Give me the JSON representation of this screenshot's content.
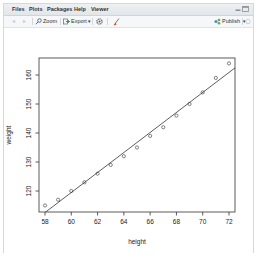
{
  "tabs": [
    {
      "label": "Files"
    },
    {
      "label": "Plots"
    },
    {
      "label": "Packages"
    },
    {
      "label": "Help"
    },
    {
      "label": "Viewer"
    }
  ],
  "toolbar": {
    "back_icon": "left-arrow-icon",
    "forward_icon": "right-arrow-icon",
    "zoom_label": "Zoom",
    "export_label": "Export",
    "export_caret": "▾",
    "refresh_icon": "gear-icon",
    "clear_icon": "broom-icon",
    "publish_label": "Publish",
    "publish_caret": "▾"
  },
  "window_controls": {
    "minimize_icon": "minimize-icon",
    "maximize_icon": "maximize-icon"
  },
  "colors": {
    "tabbar_bg": "#e6e9ec",
    "toolbar_bg": "#f6f7f8",
    "plot_line": "#222222",
    "point_stroke": "#222222"
  },
  "chart_data": {
    "type": "scatter",
    "title": "",
    "xlabel": "height",
    "ylabel": "weight",
    "xlim": [
      57.44,
      72.56
    ],
    "ylim": [
      113.04,
      165.96
    ],
    "xticks": [
      58,
      60,
      62,
      64,
      66,
      68,
      70,
      72
    ],
    "yticks": [
      120,
      130,
      140,
      150,
      160
    ],
    "grid": false,
    "legend": null,
    "x": [
      58,
      59,
      60,
      61,
      62,
      63,
      64,
      65,
      66,
      67,
      68,
      69,
      70,
      71,
      72
    ],
    "y": [
      115,
      117,
      120,
      123,
      126,
      129,
      132,
      135,
      139,
      142,
      146,
      150,
      154,
      159,
      164
    ],
    "marker": "open-circle",
    "fit_line": {
      "type": "linear",
      "intercept": -87.52,
      "slope": 3.45
    }
  }
}
